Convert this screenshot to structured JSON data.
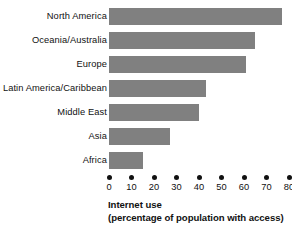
{
  "chart_data": {
    "type": "bar",
    "orientation": "horizontal",
    "title": "",
    "xlabel": "Internet use (percentage of population with access)",
    "ylabel": "",
    "xlim": [
      0,
      80
    ],
    "grid": false,
    "legend": null,
    "categories": [
      "North America",
      "Oceania/Australia",
      "Europe",
      "Latin America/Caribbean",
      "Middle East",
      "Asia",
      "Africa"
    ],
    "values": [
      77,
      65,
      61,
      43,
      40,
      27,
      15
    ],
    "xticks": [
      0,
      10,
      20,
      30,
      40,
      50,
      60,
      70,
      80
    ],
    "xtick_labels": [
      "0",
      "10",
      "20",
      "30",
      "40",
      "50",
      "60",
      "70",
      "80"
    ],
    "bar_color": "#808080",
    "text_color": "#111111",
    "background_color": "#ffffff"
  },
  "axis_title": {
    "line1": "Internet use",
    "line2": "(percentage of population with access)"
  }
}
